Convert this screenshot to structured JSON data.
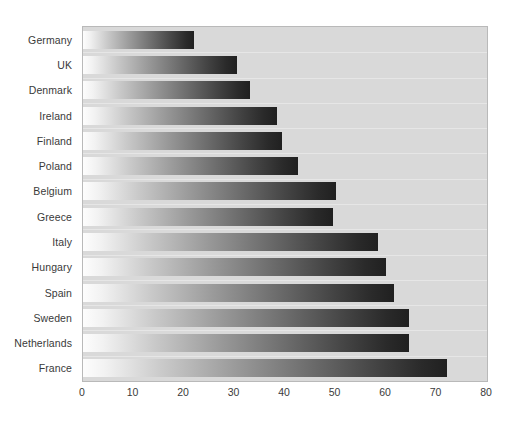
{
  "chart_data": {
    "type": "bar",
    "orientation": "horizontal",
    "title": "",
    "subtitle": "",
    "xlabel": "",
    "ylabel": "",
    "xlim": [
      0,
      80
    ],
    "ylim": null,
    "grid": false,
    "legend": null,
    "xticks": [
      "0",
      "10",
      "20",
      "30",
      "40",
      "50",
      "60",
      "70",
      "80"
    ],
    "xtick_values": [
      0,
      10,
      20,
      30,
      40,
      50,
      60,
      70,
      80
    ],
    "categories": [
      "Germany",
      "UK",
      "Denmark",
      "Ireland",
      "Finland",
      "Poland",
      "Belgium",
      "Greece",
      "Italy",
      "Hungary",
      "Spain",
      "Sweden",
      "Netherlands",
      "France"
    ],
    "values": [
      22,
      30.5,
      33,
      38.5,
      39.5,
      42.5,
      50,
      49.5,
      58.5,
      60,
      61.5,
      64.5,
      64.5,
      72
    ],
    "series": [
      {
        "name": "",
        "values": [
          22,
          30.5,
          33,
          38.5,
          39.5,
          42.5,
          50,
          49.5,
          58.5,
          60,
          61.5,
          64.5,
          64.5,
          72
        ]
      }
    ]
  },
  "style": {
    "plot_background": "#d9d9d9",
    "plot_border": "#b9b9b9",
    "page_background": "#ffffff",
    "label_color": "#3a3a3a",
    "bar_gradient_start": "#fdfdfd",
    "bar_gradient_end": "#202020"
  }
}
